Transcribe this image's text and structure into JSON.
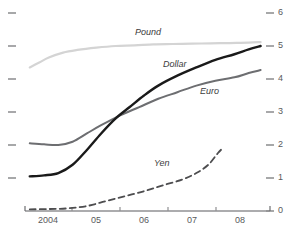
{
  "chart_data": {
    "type": "line",
    "title": "",
    "xlabel": "",
    "ylabel": "",
    "xlim": [
      2003.5,
      2008.5
    ],
    "ylim": [
      0,
      6
    ],
    "grid": false,
    "legend_position": "inline-labels",
    "x_tick_labels": [
      "2004",
      "05",
      "06",
      "07",
      "08"
    ],
    "y_tick_labels": [
      "0",
      "1",
      "2",
      "3",
      "4",
      "5",
      "6"
    ],
    "y_ticks": [
      0,
      1,
      2,
      3,
      4,
      5,
      6
    ],
    "y_axis_side": "right",
    "series": [
      {
        "name": "Pound",
        "color": "#d4d4d4",
        "style": "solid",
        "width": 2.2,
        "x": [
          2003.6,
          2003.8,
          2004.0,
          2004.3,
          2004.6,
          2005.0,
          2005.4,
          2005.8,
          2006.2,
          2006.6,
          2007.0,
          2007.4,
          2007.8,
          2008.2,
          2008.45
        ],
        "values": [
          4.35,
          4.5,
          4.65,
          4.8,
          4.88,
          4.95,
          5.0,
          5.02,
          5.05,
          5.06,
          5.07,
          5.08,
          5.09,
          5.1,
          5.12
        ]
      },
      {
        "name": "Dollar",
        "color": "#1a1a1a",
        "style": "solid",
        "width": 2.4,
        "x": [
          2003.6,
          2003.9,
          2004.2,
          2004.5,
          2004.8,
          2005.1,
          2005.4,
          2005.7,
          2006.0,
          2006.3,
          2006.7,
          2007.1,
          2007.5,
          2007.9,
          2008.2,
          2008.45
        ],
        "values": [
          1.05,
          1.08,
          1.15,
          1.4,
          1.85,
          2.35,
          2.8,
          3.15,
          3.5,
          3.8,
          4.1,
          4.35,
          4.58,
          4.75,
          4.9,
          5.0
        ]
      },
      {
        "name": "Euro",
        "color": "#6d6e71",
        "style": "solid",
        "width": 2.0,
        "x": [
          2003.6,
          2003.9,
          2004.2,
          2004.5,
          2004.8,
          2005.1,
          2005.5,
          2005.9,
          2006.3,
          2006.7,
          2007.1,
          2007.5,
          2007.9,
          2008.2,
          2008.45
        ],
        "values": [
          2.05,
          2.02,
          2.0,
          2.1,
          2.35,
          2.6,
          2.9,
          3.15,
          3.4,
          3.6,
          3.8,
          3.95,
          4.05,
          4.18,
          4.27
        ]
      },
      {
        "name": "Yen",
        "color": "#4d4d4f",
        "style": "dashed",
        "width": 1.8,
        "x": [
          2003.6,
          2004.0,
          2004.4,
          2004.8,
          2005.2,
          2005.6,
          2006.0,
          2006.4,
          2006.8,
          2007.1,
          2007.35,
          2007.55,
          2007.65
        ],
        "values": [
          0.05,
          0.06,
          0.08,
          0.15,
          0.3,
          0.45,
          0.6,
          0.78,
          0.95,
          1.15,
          1.4,
          1.75,
          1.9
        ]
      }
    ],
    "annotations": [
      {
        "text": "Pound",
        "x": 135,
        "y": 28
      },
      {
        "text": "Dollar",
        "x": 163,
        "y": 60
      },
      {
        "text": "Euro",
        "x": 200,
        "y": 87
      },
      {
        "text": "Yen",
        "x": 154,
        "y": 159
      }
    ]
  },
  "axis": {
    "x_ticks": [
      {
        "label": "2004",
        "x": 48
      },
      {
        "label": "05",
        "x": 96
      },
      {
        "label": "06",
        "x": 144
      },
      {
        "label": "07",
        "x": 192
      },
      {
        "label": "08",
        "x": 240
      }
    ],
    "y_ticks_right": [
      {
        "label": "6",
        "y": 13
      },
      {
        "label": "5",
        "y": 46
      },
      {
        "label": "4",
        "y": 79
      },
      {
        "label": "3",
        "y": 112
      },
      {
        "label": "2",
        "y": 145
      },
      {
        "label": "1",
        "y": 178
      },
      {
        "label": "0",
        "y": 211
      }
    ]
  }
}
